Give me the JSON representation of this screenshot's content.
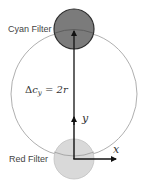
{
  "diagram": {
    "labels": {
      "cyan_filter": "Cyan Filter",
      "red_filter": "Red Filter",
      "y_axis": "y",
      "x_axis": "x"
    },
    "formula": {
      "delta": "Δ",
      "base": "c",
      "subscript": "y",
      "rest": " = 2r"
    },
    "shapes": {
      "big_circle": {
        "cx": 74,
        "cy": 94,
        "r": 63,
        "stroke": "#999999"
      },
      "cyan_filter_circle": {
        "cx": 74,
        "cy": 29,
        "r": 20,
        "fill": "#7a7a7a",
        "stroke": "#333333"
      },
      "red_filter_circle": {
        "cx": 74,
        "cy": 159,
        "r": 20,
        "fill": "#d8d8d8",
        "stroke": "#c0c0c0"
      }
    },
    "colors": {
      "axis": "#111111",
      "background": "#ffffff"
    }
  }
}
